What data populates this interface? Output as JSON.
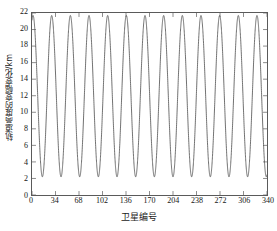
{
  "chart_data": {
    "type": "line",
    "title": "",
    "xlabel": "卫星编号",
    "ylabel": "轨道高度的变幅变化/km",
    "xlim": [
      0,
      340
    ],
    "ylim": [
      0,
      22
    ],
    "xticks": [
      0,
      34,
      68,
      102,
      136,
      170,
      204,
      238,
      272,
      306,
      340
    ],
    "yticks": [
      0,
      2,
      4,
      6,
      8,
      10,
      12,
      14,
      16,
      18,
      20,
      22
    ],
    "grid": false,
    "legend": null,
    "line_color": "#4d4d4d",
    "line_width": 0.8,
    "series": [
      {
        "name": "轨道高度变幅",
        "description": "正弦振荡，周期约27个卫星编号，峰值约21.7 km，谷值约2.2 km",
        "period": 27.0,
        "amplitude": 9.75,
        "offset": 11.95,
        "phase_deg": 70,
        "peak_value": 21.7,
        "trough_value": 2.2,
        "cycles_visible": 12.6,
        "x_start": 0,
        "x_end": 340,
        "sample_points": [
          {
            "x": 0,
            "y": 21.0
          },
          {
            "x": 7,
            "y": 11.9
          },
          {
            "x": 13.5,
            "y": 2.2
          },
          {
            "x": 20,
            "y": 11.9
          },
          {
            "x": 27,
            "y": 21.7
          },
          {
            "x": 34,
            "y": 11.9
          },
          {
            "x": 40.5,
            "y": 2.2
          },
          {
            "x": 47,
            "y": 11.9
          },
          {
            "x": 54,
            "y": 21.7
          },
          {
            "x": 61,
            "y": 11.9
          },
          {
            "x": 67.5,
            "y": 2.2
          },
          {
            "x": 74,
            "y": 11.9
          },
          {
            "x": 81,
            "y": 21.7
          },
          {
            "x": 88,
            "y": 11.9
          },
          {
            "x": 94.5,
            "y": 2.2
          },
          {
            "x": 101,
            "y": 11.9
          },
          {
            "x": 108,
            "y": 21.7
          },
          {
            "x": 115,
            "y": 11.9
          },
          {
            "x": 121.5,
            "y": 2.2
          },
          {
            "x": 128,
            "y": 11.9
          },
          {
            "x": 135,
            "y": 21.7
          },
          {
            "x": 142,
            "y": 11.9
          },
          {
            "x": 148.5,
            "y": 2.2
          },
          {
            "x": 155,
            "y": 11.9
          },
          {
            "x": 162,
            "y": 21.7
          },
          {
            "x": 169,
            "y": 11.9
          },
          {
            "x": 175.5,
            "y": 2.2
          },
          {
            "x": 182,
            "y": 11.9
          },
          {
            "x": 189,
            "y": 21.7
          },
          {
            "x": 196,
            "y": 11.9
          },
          {
            "x": 202.5,
            "y": 2.2
          },
          {
            "x": 209,
            "y": 11.9
          },
          {
            "x": 216,
            "y": 21.7
          },
          {
            "x": 223,
            "y": 11.9
          },
          {
            "x": 229.5,
            "y": 2.2
          },
          {
            "x": 236,
            "y": 11.9
          },
          {
            "x": 243,
            "y": 21.7
          },
          {
            "x": 250,
            "y": 11.9
          },
          {
            "x": 256.5,
            "y": 2.2
          },
          {
            "x": 263,
            "y": 11.9
          },
          {
            "x": 270,
            "y": 21.7
          },
          {
            "x": 277,
            "y": 11.9
          },
          {
            "x": 283.5,
            "y": 2.2
          },
          {
            "x": 290,
            "y": 11.9
          },
          {
            "x": 297,
            "y": 21.7
          },
          {
            "x": 304,
            "y": 11.9
          },
          {
            "x": 310.5,
            "y": 2.2
          },
          {
            "x": 317,
            "y": 11.9
          },
          {
            "x": 324,
            "y": 21.7
          },
          {
            "x": 331,
            "y": 11.9
          },
          {
            "x": 337.5,
            "y": 2.2
          },
          {
            "x": 340,
            "y": 7.0
          }
        ]
      }
    ]
  }
}
